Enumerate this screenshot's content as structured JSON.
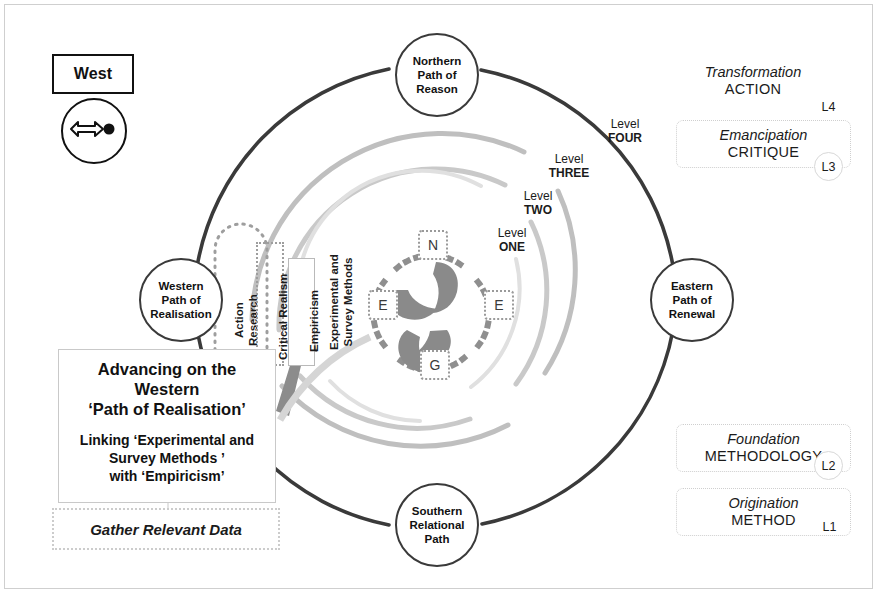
{
  "legend": {
    "west_label": "West",
    "compass_icon": "arrow-dot-compass-icon"
  },
  "levels": [
    {
      "id": "L4",
      "italic": "Transformation",
      "caps": "ACTION",
      "badge": "L4"
    },
    {
      "id": "L3",
      "italic": "Emancipation",
      "caps": "CRITIQUE",
      "badge": "L3"
    },
    {
      "id": "L2",
      "italic": "Foundation",
      "caps": "METHODOLOGY",
      "badge": "L2"
    },
    {
      "id": "L1",
      "italic": "Origination",
      "caps": "METHOD",
      "badge": "L1"
    }
  ],
  "paths": [
    {
      "key": "north",
      "line1": "Northern",
      "line2": "Path of",
      "line3": "Reason"
    },
    {
      "key": "east",
      "line1": "Eastern",
      "line2": "Path of",
      "line3": "Renewal"
    },
    {
      "key": "south",
      "line1": "Southern",
      "line2": "Relational",
      "line3": "Path"
    },
    {
      "key": "west",
      "line1": "Western",
      "line2": "Path of",
      "line3": "Realisation"
    }
  ],
  "ring_labels": [
    {
      "key": "four",
      "word1": "Level",
      "word2": "FOUR"
    },
    {
      "key": "three",
      "word1": "Level",
      "word2": "THREE"
    },
    {
      "key": "two",
      "word1": "Level",
      "word2": "TWO"
    },
    {
      "key": "one",
      "word1": "Level",
      "word2": "ONE"
    }
  ],
  "methods": [
    {
      "key": "action-research",
      "text": "Action\nResearch"
    },
    {
      "key": "critical-realism",
      "text": "Critical Realism"
    },
    {
      "key": "empiricism",
      "text": "Empiricism"
    },
    {
      "key": "experimental",
      "text": "Experimental and\nSurvey Methods"
    }
  ],
  "hub": {
    "north": "N",
    "east": "E",
    "west": "E",
    "south": "G"
  },
  "callout": {
    "title_l1": "Advancing on the",
    "title_l2": "Western",
    "title_l3": "‘Path of Realisation’",
    "sub_l1": "Linking ‘Experimental and",
    "sub_l2": "Survey Methods ’",
    "sub_l3": "with ‘Empiricism’"
  },
  "gather": {
    "label": "Gather Relevant Data"
  },
  "colors": {
    "outer_ring": "#3a3a3a",
    "ring_l3": "#c4c4c4",
    "ring_l2": "#cfcfcf",
    "ring_l1": "#e2e2e2",
    "hub_blade": "#8a8a8a",
    "arrow": "#8c8c8c",
    "text": "#1b1b1b",
    "frame": "#cfcfcf"
  }
}
